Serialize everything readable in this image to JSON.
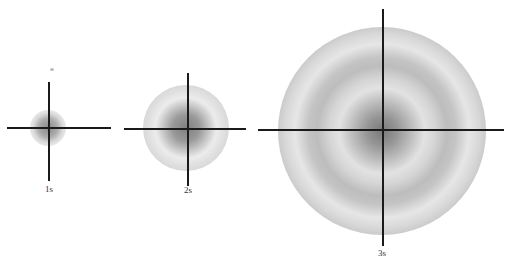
{
  "diagram": {
    "panels": [
      {
        "label": "1s",
        "center": [
          48,
          128
        ],
        "rings": 1
      },
      {
        "label": "2s",
        "center": [
          186,
          128
        ],
        "rings": 2
      },
      {
        "label": "3s",
        "center": [
          382,
          130
        ],
        "rings": 3
      }
    ]
  }
}
